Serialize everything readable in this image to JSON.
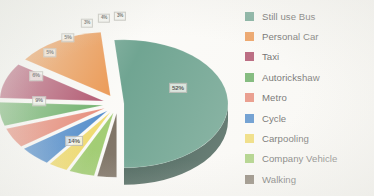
{
  "chart_data": {
    "type": "pie",
    "title": "",
    "subtitle": "",
    "xlabel": "",
    "ylabel": "",
    "legend_position": "right",
    "grid": false,
    "exploded": true,
    "three_d": true,
    "categories": [
      "Still use Bus",
      "Personal Car",
      "Taxi",
      "Autorickshaw",
      "Metro",
      "Cycle",
      "Carpooling",
      "Company Vehicle",
      "Walking"
    ],
    "values": [
      52,
      14,
      9,
      6,
      5,
      5,
      3,
      4,
      3
    ],
    "value_labels": [
      "52%",
      "14%",
      "9%",
      "6%",
      "5%",
      "5%",
      "3%",
      "4%",
      "3%"
    ],
    "colors": [
      "#4e8f78",
      "#e8802c",
      "#9e2b4c",
      "#4a9d45",
      "#e2705a",
      "#2a72c0",
      "#ecd24e",
      "#8cc152",
      "#5e5140"
    ],
    "side_colors": [
      "#1e3e33",
      "#a85a1b",
      "#6b1c33",
      "#2d6429",
      "#a34a39",
      "#1b4e85",
      "#b09a2e",
      "#5f8a35",
      "#3c3328"
    ]
  },
  "legend": {
    "items": [
      {
        "label": "Still use Bus",
        "color": "#4e8f78"
      },
      {
        "label": "Personal Car",
        "color": "#e8802c"
      },
      {
        "label": "Taxi",
        "color": "#9e2b4c"
      },
      {
        "label": "Autorickshaw",
        "color": "#4a9d45"
      },
      {
        "label": "Metro",
        "color": "#e2705a"
      },
      {
        "label": "Cycle",
        "color": "#2a72c0"
      },
      {
        "label": "Carpooling",
        "color": "#ecd24e"
      },
      {
        "label": "Company Vehicle",
        "color": "#8cc152"
      },
      {
        "label": "Walking",
        "color": "#5e5140"
      }
    ]
  },
  "slice_labels": [
    {
      "text": "52%",
      "x": 178,
      "y": 88,
      "font_size": 6.2
    },
    {
      "text": "14%",
      "x": 74,
      "y": 141,
      "font_size": 6.2
    },
    {
      "text": "9%",
      "x": 39,
      "y": 101,
      "font_size": 5.6
    },
    {
      "text": "6%",
      "x": 36,
      "y": 76,
      "font_size": 5.6
    },
    {
      "text": "5%",
      "x": 50,
      "y": 53,
      "font_size": 5.4
    },
    {
      "text": "5%",
      "x": 68,
      "y": 38,
      "font_size": 5.4
    },
    {
      "text": "3%",
      "x": 87,
      "y": 23,
      "font_size": 4.6
    },
    {
      "text": "4%",
      "x": 104,
      "y": 18,
      "font_size": 4.6
    },
    {
      "text": "3%",
      "x": 120,
      "y": 16,
      "font_size": 4.6
    }
  ]
}
